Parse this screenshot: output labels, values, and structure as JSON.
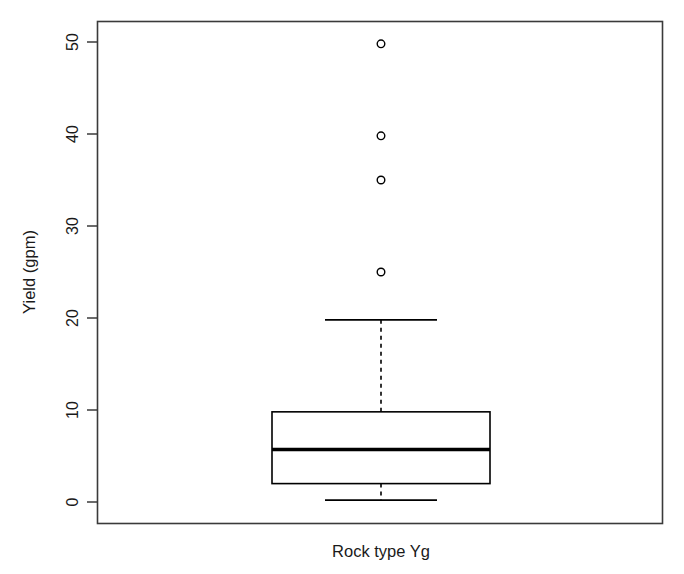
{
  "chart_data": {
    "type": "box",
    "title": "",
    "xlabel": "Rock type Yg",
    "ylabel": "Yield (gpm)",
    "categories": [
      "Rock type Yg"
    ],
    "ylim": [
      -2.5,
      52.5
    ],
    "yticks": [
      0,
      10,
      20,
      30,
      40,
      50
    ],
    "ytick_labels": [
      "0",
      "10",
      "20",
      "30",
      "40",
      "50"
    ],
    "grid": false,
    "legend": null,
    "box_color": "#000000",
    "boxes": [
      {
        "label": "Rock type Yg",
        "min_whisker": 0.2,
        "q1": 2.0,
        "median": 5.7,
        "q3": 9.8,
        "max_whisker": 19.8,
        "outliers": [
          49.8,
          39.8,
          35.0,
          25.0
        ]
      }
    ]
  },
  "axes": {
    "y_title": "Yield (gpm)",
    "x_title": "Rock type Yg",
    "y_tick_0": "0",
    "y_tick_1": "10",
    "y_tick_2": "20",
    "y_tick_3": "30",
    "y_tick_4": "40",
    "y_tick_5": "50"
  }
}
